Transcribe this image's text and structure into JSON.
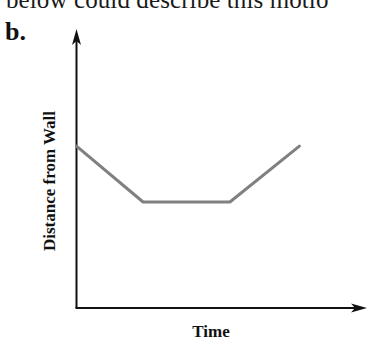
{
  "header": {
    "clipped_text": "below could describe this motio",
    "panel_label": "b."
  },
  "colors": {
    "axis": "#111111",
    "line": "#808080",
    "background": "#ffffff"
  },
  "chart_data": {
    "type": "line",
    "title": "",
    "xlabel": "Time",
    "ylabel": "Distance from Wall",
    "grid": false,
    "legend": null,
    "axis_ticks": false,
    "x": [
      0,
      0.23,
      0.53,
      0.77
    ],
    "series": [
      {
        "name": "Distance from Wall",
        "values": [
          0.58,
          0.38,
          0.38,
          0.58
        ]
      }
    ],
    "xlim": [
      0,
      1
    ],
    "ylim": [
      0,
      1
    ]
  }
}
